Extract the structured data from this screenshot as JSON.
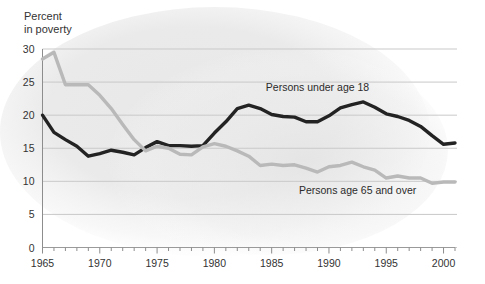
{
  "chart_data": {
    "type": "line",
    "title": "",
    "ylabel": "Percent in poverty",
    "ylabel_line1": "Percent",
    "ylabel_line2": "in poverty",
    "xlabel": "",
    "ylim": [
      0,
      30
    ],
    "xlim": [
      1965,
      2001
    ],
    "yticks": [
      0,
      5,
      10,
      15,
      20,
      25,
      30
    ],
    "ytick_labels": [
      "0",
      "5",
      "10",
      "15",
      "20",
      "25",
      "30"
    ],
    "xticks": [
      1965,
      1970,
      1975,
      1980,
      1985,
      1990,
      1995,
      2000
    ],
    "xtick_labels": [
      "1965",
      "1970",
      "1975",
      "1980",
      "1985",
      "1990",
      "1995",
      "2000"
    ],
    "minor_xticks_every": 1,
    "grid": "horizontal",
    "legend_position": "inline-annotations",
    "x": [
      1965,
      1966,
      1967,
      1968,
      1969,
      1970,
      1971,
      1972,
      1973,
      1974,
      1975,
      1976,
      1977,
      1978,
      1979,
      1980,
      1981,
      1982,
      1983,
      1984,
      1985,
      1986,
      1987,
      1988,
      1989,
      1990,
      1991,
      1992,
      1993,
      1994,
      1995,
      1996,
      1997,
      1998,
      1999,
      2000,
      2001
    ],
    "series": [
      {
        "name": "Persons under age 18",
        "color": "#232323",
        "width": 3.4,
        "label_x": 1989.0,
        "label_y": 23.6,
        "values": [
          20.0,
          17.4,
          16.3,
          15.3,
          13.8,
          14.2,
          14.7,
          14.4,
          14.0,
          15.1,
          16.0,
          15.4,
          15.4,
          15.3,
          15.4,
          17.3,
          19.0,
          21.0,
          21.5,
          21.0,
          20.1,
          19.8,
          19.7,
          19.0,
          19.0,
          19.9,
          21.1,
          21.6,
          22.0,
          21.2,
          20.2,
          19.8,
          19.2,
          18.3,
          16.9,
          15.6,
          15.8
        ]
      },
      {
        "name": "Persons age 65 and over",
        "color": "#b9b9b9",
        "width": 3.4,
        "label_x": 1992.5,
        "label_y": 8.1,
        "values": [
          28.5,
          29.5,
          24.6,
          24.6,
          24.6,
          23.0,
          21.0,
          18.6,
          16.3,
          14.6,
          15.3,
          15.0,
          14.1,
          14.0,
          15.2,
          15.7,
          15.3,
          14.6,
          13.8,
          12.4,
          12.6,
          12.4,
          12.5,
          12.0,
          11.4,
          12.2,
          12.4,
          12.9,
          12.2,
          11.7,
          10.5,
          10.8,
          10.5,
          10.5,
          9.7,
          9.9,
          9.9
        ]
      }
    ]
  },
  "axes": {
    "y_axis_line_color": "#888888",
    "grid_color": "#c9c9c9",
    "tick_color": "#8d8d8d"
  },
  "background": {
    "wash_color": "#ebebeb"
  }
}
